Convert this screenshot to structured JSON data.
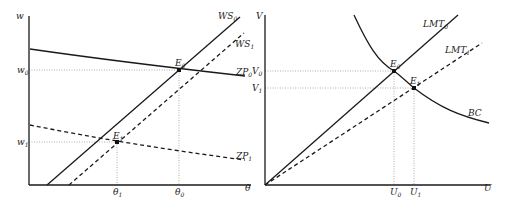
{
  "left_panel": {
    "y_axis_label": "w",
    "x_axis_label": "θ",
    "y_ticks": [
      {
        "label": "w",
        "sub": "0"
      },
      {
        "label": "w",
        "sub": "1"
      }
    ],
    "x_ticks": [
      {
        "label": "θ",
        "sub": "1"
      },
      {
        "label": "θ",
        "sub": "0"
      }
    ],
    "curves": {
      "ws0": {
        "label": "WS",
        "sub": "0",
        "style": "solid"
      },
      "ws1": {
        "label": "WS",
        "sub": "1",
        "style": "dashed"
      },
      "zp0": {
        "label": "ZP",
        "sub": "0",
        "style": "solid"
      },
      "zp1": {
        "label": "ZP",
        "sub": "1",
        "style": "dashed"
      }
    },
    "points": [
      {
        "label": "E",
        "sub": "0"
      },
      {
        "label": "E",
        "sub": "1"
      }
    ]
  },
  "right_panel": {
    "y_axis_label": "V",
    "x_axis_label": "U",
    "y_ticks": [
      {
        "label": "V",
        "sub": "0"
      },
      {
        "label": "V",
        "sub": "1"
      }
    ],
    "x_ticks": [
      {
        "label": "U",
        "sub": "0"
      },
      {
        "label": "U",
        "sub": "1"
      }
    ],
    "curves": {
      "lmt0": {
        "label": "LMT",
        "sub": "0",
        "style": "solid"
      },
      "lmt1": {
        "label": "LMT",
        "sub": "1",
        "style": "dashed"
      },
      "bc": {
        "label": "BC",
        "style": "solid"
      }
    },
    "points": [
      {
        "label": "E",
        "sub": "0"
      },
      {
        "label": "E",
        "sub": "1"
      }
    ]
  },
  "colors": {
    "line": "#1a1a1a",
    "guide": "#999999"
  }
}
